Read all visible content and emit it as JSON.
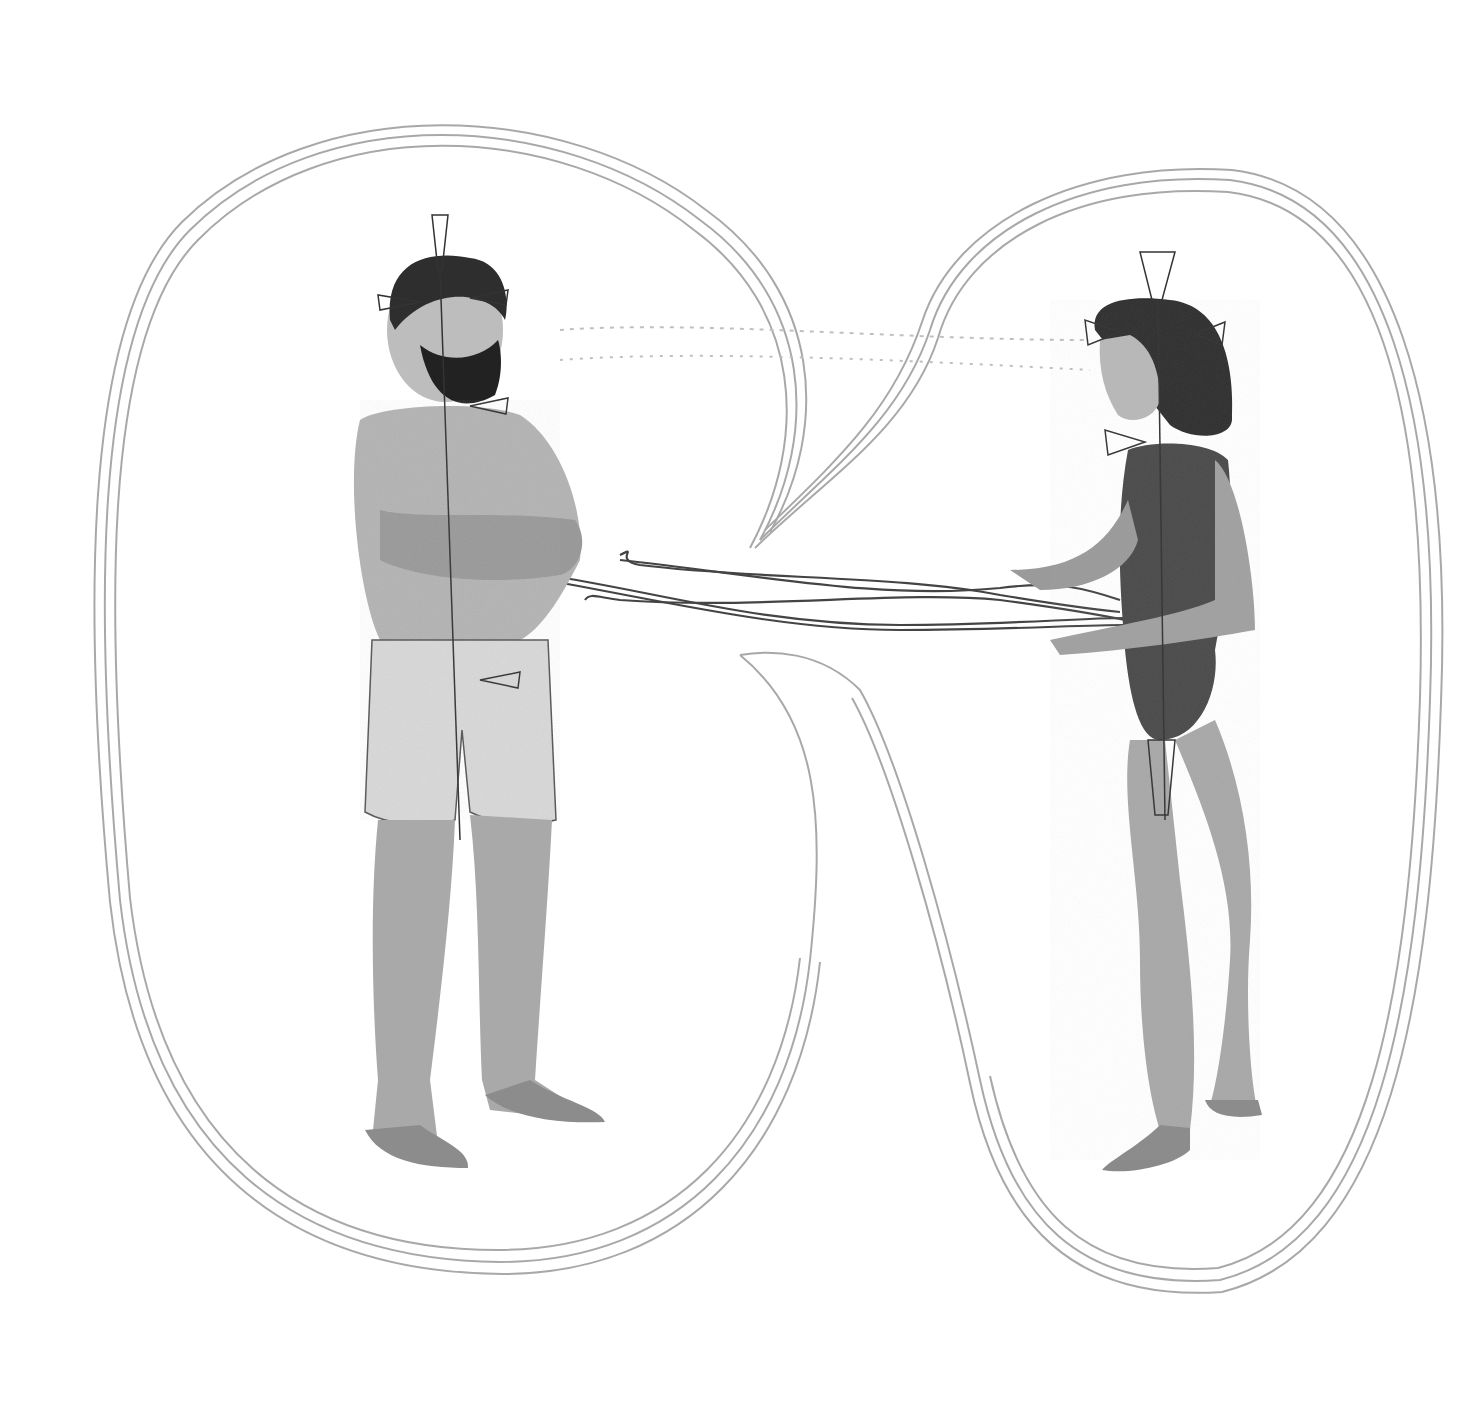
{
  "illustration": {
    "style": "graphite pencil drawing on white paper",
    "description": "A bearded man in boxer shorts with arms crossed stands on the left facing a woman in a dark leotard on the right who gestures with open hands; each figure is enclosed in a sketched aura-like oval, the two ovals joined by a narrow bridge, and bundles of cord-like strands with hooked ends stretch between them at waist height. Small cone/funnel shapes are drawn at each figure's crown, temples, throat, heart, navel and pelvis along a vertical center line.",
    "colors": {
      "background": "#ffffff",
      "aura_lines": "#9a9a9a",
      "figure_shading": "#3a3a3a",
      "ink_dark": "#1a1a1a"
    },
    "figures": [
      {
        "id": "man",
        "position": "left",
        "pose": "arms crossed, standing"
      },
      {
        "id": "woman",
        "position": "right",
        "pose": "hands open, speaking"
      }
    ]
  }
}
